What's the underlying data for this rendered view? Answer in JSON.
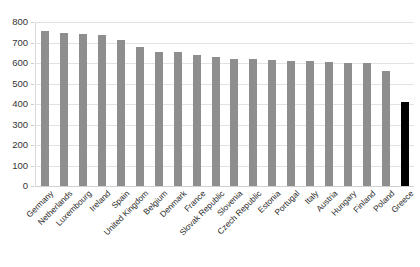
{
  "chart_data": {
    "type": "bar",
    "title": "",
    "subtitle": "",
    "xlabel": "",
    "ylabel": "",
    "ylim": [
      0,
      800
    ],
    "ytick_step": 100,
    "yticks": [
      800,
      700,
      600,
      500,
      400,
      300,
      200,
      100,
      0
    ],
    "ytick_labels": [
      "800",
      "700",
      "600",
      "500",
      "400",
      "300",
      "200",
      "100",
      "0"
    ],
    "grid": true,
    "legend": "none",
    "categories": [
      "Germany",
      "Netherlands",
      "Luxembourg",
      "Ireland",
      "Spain",
      "United Kingdom",
      "Belgium",
      "Denmark",
      "France",
      "Slovak Republic",
      "Slovenia",
      "Czech Republic",
      "Estonia",
      "Portugal",
      "Italy",
      "Austria",
      "Hungary",
      "Finland",
      "Poland",
      "Greece"
    ],
    "values": [
      755,
      748,
      740,
      735,
      712,
      678,
      655,
      652,
      640,
      630,
      620,
      618,
      615,
      612,
      608,
      605,
      602,
      598,
      560,
      410
    ],
    "colors": {
      "bar": "#8e8e8e",
      "highlight_bar": "#000000",
      "gridline": "#e2e2e2",
      "background": "#ffffff",
      "text": "#2b2b2b"
    },
    "highlight_index": 19
  }
}
